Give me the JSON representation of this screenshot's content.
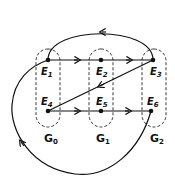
{
  "nodes": [
    {
      "id": "E1",
      "base": "E",
      "sub": "1",
      "x": 48,
      "y": 60
    },
    {
      "id": "E2",
      "base": "E",
      "sub": "2",
      "x": 101,
      "y": 60
    },
    {
      "id": "E3",
      "base": "E",
      "sub": "3",
      "x": 153,
      "y": 60
    },
    {
      "id": "E4",
      "base": "E",
      "sub": "4",
      "x": 48,
      "y": 111
    },
    {
      "id": "E5",
      "base": "E",
      "sub": "5",
      "x": 101,
      "y": 111
    },
    {
      "id": "E6",
      "base": "E",
      "sub": "6",
      "x": 151,
      "y": 111
    }
  ],
  "groups": [
    {
      "id": "G0",
      "base": "G",
      "sub": "0",
      "members": [
        "E1",
        "E4"
      ]
    },
    {
      "id": "G1",
      "base": "G",
      "sub": "1",
      "members": [
        "E2",
        "E5"
      ]
    },
    {
      "id": "G2",
      "base": "G",
      "sub": "2",
      "members": [
        "E3",
        "E6"
      ]
    }
  ],
  "edges": [
    {
      "from": "E1",
      "to": "E2"
    },
    {
      "from": "E2",
      "to": "E3"
    },
    {
      "from": "E3",
      "to": "E1",
      "style": "arc-over-top"
    },
    {
      "from": "E3",
      "to": "E4"
    },
    {
      "from": "E4",
      "to": "E5"
    },
    {
      "from": "E5",
      "to": "E6"
    },
    {
      "from": "E6",
      "to": "E1",
      "style": "loop-around-bottom-left"
    }
  ]
}
